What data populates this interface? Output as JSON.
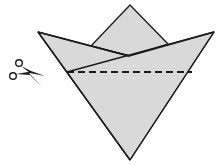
{
  "diagram": {
    "type": "paper-folding-instruction",
    "colors": {
      "paper_fill": "#d9d9d9",
      "outline": "#1a1a1a",
      "background": "#ffffff"
    },
    "shapes": {
      "back_square": [
        [
          91,
          46
        ],
        [
          130,
          5
        ],
        [
          168,
          44
        ]
      ],
      "main_triangle": [
        [
          38,
          32
        ],
        [
          214,
          32
        ],
        [
          130,
          160
        ]
      ],
      "left_flap": [
        [
          38,
          32
        ],
        [
          129,
          56
        ],
        [
          67,
          72
        ]
      ],
      "right_flap": [
        [
          67,
          72
        ],
        [
          214,
          32
        ],
        [
          192,
          72
        ]
      ]
    },
    "cut_line": {
      "style": "dashed",
      "from": [
        67,
        72
      ],
      "to": [
        192,
        72
      ]
    },
    "icons": [
      {
        "name": "scissors-icon",
        "position": [
          10,
          59
        ],
        "meaning": "cut along the dashed line"
      }
    ]
  }
}
